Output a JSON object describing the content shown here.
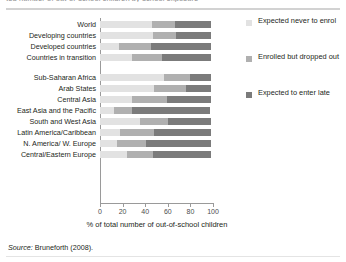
{
  "top_clipped_text": "ted number of out-of-school children by school exposure",
  "source": {
    "label": "Source:",
    "text": "Bruneforth (2008)."
  },
  "legend": {
    "items": [
      {
        "label": "Expected never to enrol",
        "color": "#e2e2e2",
        "key": "never_enrol"
      },
      {
        "label": "Enrolled but dropped out",
        "color": "#b0b0b0",
        "key": "dropped_out"
      },
      {
        "label": "Expected to enter late",
        "color": "#7b7b7b",
        "key": "enter_late"
      }
    ]
  },
  "chart_data": {
    "type": "bar",
    "orientation": "horizontal",
    "stacked": true,
    "title": "",
    "xlabel": "% of total number of out-of-school children",
    "ylabel": "",
    "xlim": [
      0,
      100
    ],
    "xticks": [
      0,
      20,
      40,
      60,
      80,
      100
    ],
    "grid": false,
    "legend_position": "right",
    "categories": [
      "World",
      "Developing countries",
      "Developed countries",
      "Countries in transition",
      "Sub-Saharan Africa",
      "Arab States",
      "Central Asia",
      "East Asia and the Pacific",
      "South and West Asia",
      "Latin America/Caribbean",
      "N. America/ W. Europe",
      "Central/Eastern Europe"
    ],
    "series": [
      {
        "name": "Expected never to enrol",
        "color": "#e2e2e2",
        "values": [
          46,
          47,
          17,
          28,
          57,
          48,
          28,
          12,
          35,
          18,
          15,
          24
        ]
      },
      {
        "name": "Enrolled but dropped out",
        "color": "#b0b0b0",
        "values": [
          20,
          20,
          28,
          27,
          23,
          28,
          31,
          16,
          25,
          30,
          26,
          23
        ]
      },
      {
        "name": "Expected to enter late",
        "color": "#7b7b7b",
        "values": [
          32,
          31,
          53,
          43,
          18,
          22,
          39,
          69,
          38,
          50,
          57,
          51
        ]
      }
    ]
  }
}
